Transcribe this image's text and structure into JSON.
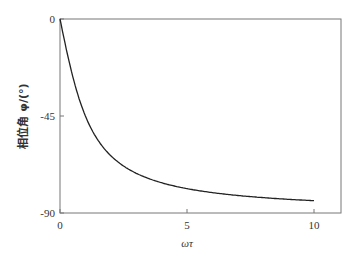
{
  "chart_data": {
    "type": "line",
    "title": "",
    "xlabel": "ωτ",
    "ylabel": "相位角 φ/(°)",
    "xlim": [
      0,
      11
    ],
    "ylim": [
      -90,
      0
    ],
    "xticks": [
      0,
      5,
      10
    ],
    "yticks": [
      0,
      -45,
      -90
    ],
    "grid": false,
    "legend": null,
    "series": [
      {
        "name": "phase",
        "x": [
          0,
          0.25,
          0.5,
          0.75,
          1,
          1.5,
          2,
          2.5,
          3,
          4,
          5,
          6,
          7,
          8,
          9,
          10
        ],
        "values": [
          0,
          -14.0,
          -26.6,
          -36.9,
          -45.0,
          -56.3,
          -63.4,
          -68.2,
          -71.6,
          -76.0,
          -78.7,
          -80.5,
          -81.9,
          -82.9,
          -83.7,
          -84.3
        ]
      }
    ]
  },
  "labels": {
    "x0": "0",
    "x5": "5",
    "x10": "10",
    "y0": "0",
    "y45": "-45",
    "y90": "-90",
    "xlabel": "ωτ",
    "ylabel": "相位角 φ/(°)"
  }
}
